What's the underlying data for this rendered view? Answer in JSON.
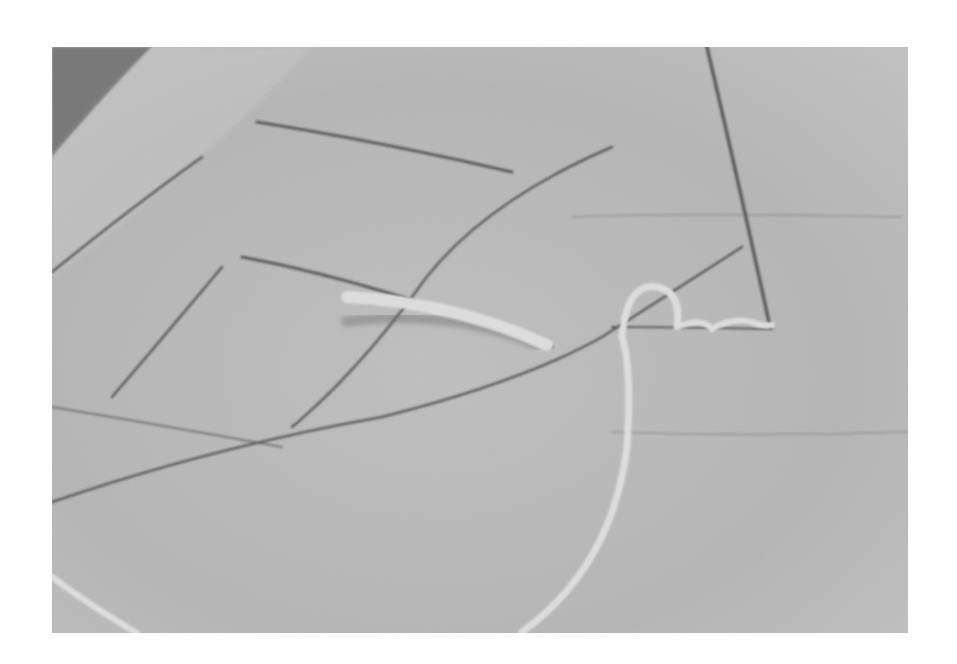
{
  "image": {
    "description": "Grayscale photograph of a textured fabric/felt surface with dark drawn lines and a white cord",
    "colors": {
      "background": "#ffffff",
      "surface": "#b9b9b9",
      "surface_light": "#cfcfcf",
      "corner_dark": "#5a5a5a",
      "lines": "#2e2e2e",
      "cord": "#f2f2f2"
    }
  }
}
